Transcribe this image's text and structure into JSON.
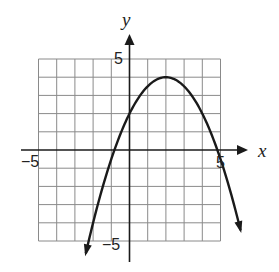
{
  "chart_data": {
    "type": "line",
    "title": "",
    "xlabel": "x",
    "ylabel": "y",
    "xlim": [
      -5,
      5
    ],
    "ylim": [
      -5,
      5
    ],
    "grid": true,
    "grid_step": 1,
    "tick_labels": {
      "x": [
        {
          "value": -5,
          "label": "−5"
        },
        {
          "value": 5,
          "label": "5"
        }
      ],
      "y": [
        {
          "value": 5,
          "label": "5"
        },
        {
          "value": -5,
          "label": "−5"
        }
      ]
    },
    "series": [
      {
        "name": "parabola",
        "equation": "y = -0.5(x - 2)^2 + 4",
        "vertex": [
          2,
          4
        ],
        "y_intercept": 2,
        "x_intercepts": [
          -0.83,
          4.83
        ],
        "x_range": [
          -2.4,
          6.1
        ],
        "arrows_both_ends": true,
        "color": "#1a1a1a"
      }
    ]
  },
  "labels": {
    "x_axis": "x",
    "y_axis": "y",
    "x_min": "−5",
    "x_max": "5",
    "y_max": "5",
    "y_min": "−5"
  }
}
